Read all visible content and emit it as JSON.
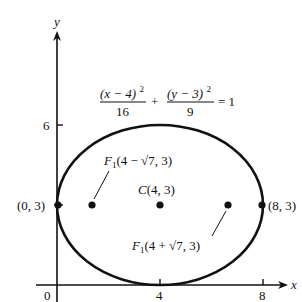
{
  "figure": {
    "part_label_fragment": ")",
    "axes": {
      "x_label": "x",
      "y_label": "y",
      "origin_label": "0",
      "x_ticks": [
        "4",
        "8"
      ],
      "y_ticks": [
        "6"
      ]
    },
    "equation": {
      "term1_numerator": "(x − 4)",
      "term1_exponent": "2",
      "term1_denominator": "16",
      "plus": "+",
      "term2_numerator": "(y − 3)",
      "term2_exponent": "2",
      "term2_denominator": "9",
      "equals": "= 1"
    },
    "points": {
      "center": {
        "name": "C",
        "coords": "(4, 3)"
      },
      "focus_left": {
        "name": "F",
        "subscript": "1",
        "coords": "(4 − √7, 3)"
      },
      "focus_right": {
        "name": "F",
        "subscript": "1",
        "coords": "(4 + √7, 3)"
      },
      "vertex_left": {
        "coords": "(0, 3)"
      },
      "vertex_right": {
        "coords": "(8, 3)"
      }
    },
    "ellipse": {
      "center": [
        4,
        3
      ],
      "semi_major_x": 4,
      "semi_minor_y": 3
    },
    "colors": {
      "stroke": "#111111",
      "background": "#ffffff"
    }
  }
}
